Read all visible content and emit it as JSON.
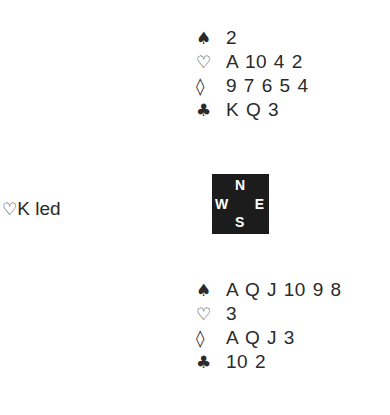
{
  "north": {
    "spades": "2",
    "hearts": "A 10 4 2",
    "diamonds": "9 7 6 5 4",
    "clubs": "K Q 3"
  },
  "south": {
    "spades": "A Q J 10 9 8",
    "hearts": "3",
    "diamonds": "A Q J 3",
    "clubs": "10 2"
  },
  "suits": {
    "spade": "♠",
    "heart": "♡",
    "diamond": "◊",
    "club": "♣"
  },
  "compass": {
    "n": "N",
    "s": "S",
    "w": "W",
    "e": "E"
  },
  "lead": {
    "suit": "♡",
    "text": "K led"
  }
}
